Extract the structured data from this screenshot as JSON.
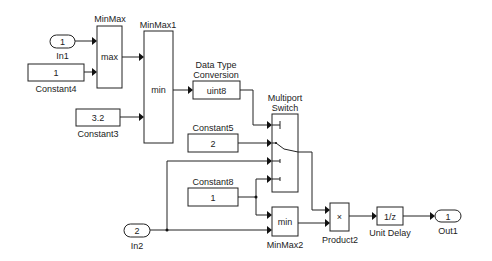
{
  "diagram": {
    "blocks": {
      "in1": {
        "label": "In1",
        "value": "1"
      },
      "in2": {
        "label": "In2",
        "value": "2"
      },
      "constant4": {
        "label": "Constant4",
        "value": "1"
      },
      "constant3": {
        "label": "Constant3",
        "value": "3.2"
      },
      "constant5": {
        "label": "Constant5",
        "value": "2"
      },
      "constant8": {
        "label": "Constant8",
        "value": "1"
      },
      "minmax": {
        "label": "MinMax",
        "value": "max"
      },
      "minmax1": {
        "label": "MinMax1",
        "value": "min"
      },
      "minmax2": {
        "label": "MinMax2",
        "value": "min"
      },
      "dtc": {
        "label_line1": "Data Type",
        "label_line2": "Conversion",
        "value": "uint8"
      },
      "switch": {
        "label_line1": "Multiport",
        "label_line2": "Switch"
      },
      "product2": {
        "label": "Product2",
        "value": "×"
      },
      "unit_delay": {
        "label": "Unit Delay",
        "value": "1/z"
      },
      "out1": {
        "label": "Out1",
        "value": "1"
      }
    }
  }
}
